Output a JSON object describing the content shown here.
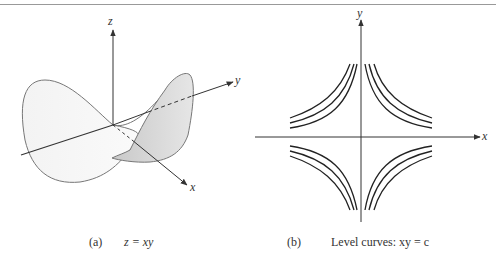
{
  "figure": {
    "panel_a": {
      "tag": "(a)",
      "caption": "z = xy",
      "axis_labels": {
        "z": "z",
        "y": "y",
        "x": "x"
      },
      "surface": "saddle (hyperbolic paraboloid)"
    },
    "panel_b": {
      "tag": "(b)",
      "caption": "Level curves: xy = c",
      "axis_labels": {
        "y": "y",
        "x": "x"
      },
      "curves_per_quadrant": 3
    }
  }
}
